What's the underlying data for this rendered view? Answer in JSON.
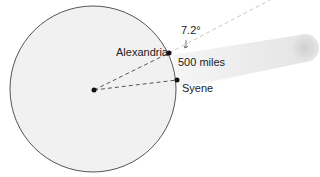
{
  "diagram": {
    "labels": {
      "angle": "7.2°",
      "city_north": "Alexandria",
      "city_south": "Syene",
      "distance": "500 miles"
    },
    "colors": {
      "earth_fill": "#ececec",
      "earth_stroke": "#444444",
      "beam": "#e6e6e6",
      "dash": "#555555",
      "dash_light": "#cccccc"
    }
  }
}
